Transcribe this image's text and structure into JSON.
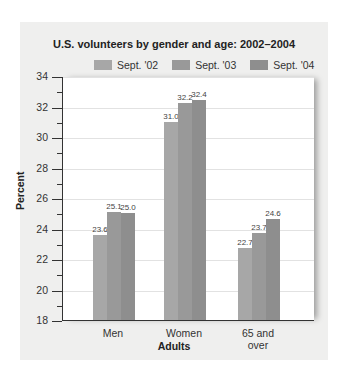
{
  "chart_data": {
    "type": "bar",
    "title": "U.S. volunteers by gender and age: 2002–2004",
    "xlabel": "Adults",
    "ylabel": "Percent",
    "ylim": [
      18,
      34
    ],
    "yticks": [
      18,
      20,
      22,
      24,
      26,
      28,
      30,
      32,
      34
    ],
    "grid": true,
    "legend_position": "top",
    "categories": [
      "Men",
      "Women",
      "65 and over"
    ],
    "series": [
      {
        "name": "Sept. '02",
        "values": [
          23.6,
          31.0,
          22.7
        ],
        "color": "#a7a7a7"
      },
      {
        "name": "Sept. '03",
        "values": [
          25.1,
          32.2,
          23.7
        ],
        "color": "#999999"
      },
      {
        "name": "Sept. '04",
        "values": [
          25.0,
          32.4,
          24.6
        ],
        "color": "#8e8e8e"
      }
    ],
    "data_labels": [
      [
        "23.6",
        "25.1",
        "25.0"
      ],
      [
        "31.0",
        "32.2",
        "32.4"
      ],
      [
        "22.7",
        "23.7",
        "24.6"
      ]
    ]
  },
  "categories_display": [
    {
      "line1": "Men",
      "line2": ""
    },
    {
      "line1": "Women",
      "line2": ""
    },
    {
      "line1": "65 and",
      "line2": "over"
    }
  ]
}
